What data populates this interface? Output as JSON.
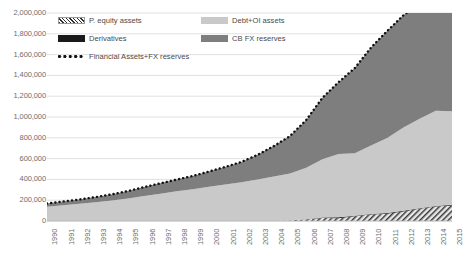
{
  "chart_data": {
    "type": "area",
    "stacked": true,
    "title": "",
    "xlabel": "",
    "ylabel": "",
    "ylim": [
      0,
      2000000
    ],
    "ytick_labels": [
      "2,000,000",
      "1,800,000",
      "1,600,000",
      "1,400,000",
      "1,200,000",
      "1,000,000",
      "800,000",
      "600,000",
      "400,000",
      "200,000",
      "0"
    ],
    "ytick_values": [
      2000000,
      1800000,
      1600000,
      1400000,
      1200000,
      1000000,
      800000,
      600000,
      400000,
      200000,
      0
    ],
    "grid": true,
    "legend_position": "top-inside",
    "categories": [
      "1990",
      "1991",
      "1992",
      "1993",
      "1994",
      "1995",
      "1996",
      "1997",
      "1998",
      "1999",
      "2000",
      "2001",
      "2002",
      "2003",
      "2004",
      "2005",
      "2006",
      "2007",
      "2008",
      "2009",
      "2010",
      "2011",
      "2012",
      "2013",
      "2014",
      "2015"
    ],
    "series": [
      {
        "name": "P. equity assets",
        "style": "hatched",
        "color": "#2b2b2b",
        "values": [
          0,
          0,
          0,
          0,
          0,
          0,
          0,
          0,
          0,
          0,
          0,
          0,
          0,
          0,
          0,
          4000,
          14000,
          30000,
          26000,
          45000,
          62000,
          70000,
          92000,
          118000,
          140000,
          150000
        ]
      },
      {
        "name": "Derivatives",
        "style": "solid",
        "color": "#1a1a1a",
        "values": [
          0,
          0,
          0,
          0,
          0,
          0,
          0,
          0,
          0,
          0,
          0,
          0,
          0,
          0,
          0,
          1000,
          2000,
          4000,
          9000,
          6000,
          5000,
          7000,
          6000,
          5000,
          5000,
          6000
        ]
      },
      {
        "name": "Debt+OI assets",
        "style": "solid",
        "color": "#c9c9c9",
        "values": [
          138000,
          152000,
          165000,
          180000,
          196000,
          216000,
          240000,
          262000,
          286000,
          305000,
          330000,
          352000,
          372000,
          398000,
          428000,
          452000,
          495000,
          560000,
          610000,
          600000,
          660000,
          720000,
          800000,
          860000,
          915000,
          900000
        ]
      },
      {
        "name": "CB FX reserves",
        "style": "solid",
        "color": "#7e7e7e",
        "values": [
          30000,
          36000,
          42000,
          50000,
          60000,
          72000,
          86000,
          100000,
          112000,
          128000,
          146000,
          168000,
          196000,
          238000,
          292000,
          360000,
          460000,
          590000,
          690000,
          820000,
          940000,
          1030000,
          1080000,
          1110000,
          1150000,
          1060000
        ]
      }
    ],
    "total_line": {
      "name": "Financial Assets+FX reserves",
      "style": "dotted",
      "color": "#111111",
      "values": [
        168000,
        188000,
        207000,
        230000,
        256000,
        288000,
        326000,
        362000,
        398000,
        433000,
        476000,
        520000,
        568000,
        636000,
        720000,
        817000,
        971000,
        1184000,
        1335000,
        1471000,
        1667000,
        1827000,
        1978000,
        2093000,
        2210000,
        2116000
      ]
    }
  },
  "legend": {
    "items": [
      {
        "label": "P. equity assets",
        "swatch": "hatched-swatch"
      },
      {
        "label": "Debt+OI assets",
        "swatch": "light-gray-swatch"
      },
      {
        "label": "Derivatives",
        "swatch": "black-swatch"
      },
      {
        "label": "CB FX reserves",
        "swatch": "dark-gray-swatch"
      },
      {
        "label": "Financial Assets+FX reserves",
        "swatch": "dotted-line-swatch"
      }
    ]
  },
  "colors": {
    "p_equity": "#2b2b2b",
    "derivatives": "#1a1a1a",
    "debt_oi": "#c9c9c9",
    "cb_fx": "#7e7e7e",
    "total_line": "#111111",
    "gridline": "#d9d9d9",
    "tick_text": "#6e6e6e"
  }
}
